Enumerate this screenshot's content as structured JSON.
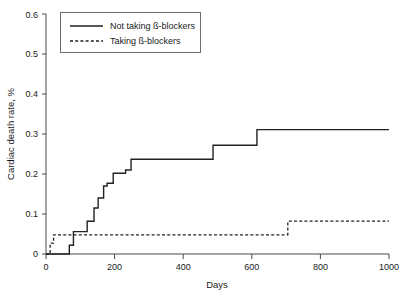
{
  "chart_data": {
    "type": "line",
    "subtype": "step",
    "title": "",
    "xlabel": "Days",
    "ylabel": "Cardiac death rate, %",
    "xlim": [
      0,
      1000
    ],
    "ylim": [
      0,
      0.6
    ],
    "xticks": [
      0,
      200,
      400,
      600,
      800,
      1000
    ],
    "xtick_labels": [
      "0",
      "200",
      "400",
      "600",
      "800",
      "1000"
    ],
    "yticks": [
      0,
      0.1,
      0.2,
      0.3,
      0.4,
      0.5,
      0.6
    ],
    "ytick_labels": [
      "0",
      "0.1",
      "0.2",
      "0.3",
      "0.4",
      "0.5",
      "0.6"
    ],
    "grid": false,
    "legend_position": "top-left",
    "series": [
      {
        "name": "Not taking ß-blockers",
        "style": "solid",
        "color": "#222222",
        "x": [
          0,
          68,
          68,
          80,
          80,
          120,
          120,
          140,
          140,
          152,
          152,
          168,
          168,
          178,
          178,
          196,
          196,
          232,
          232,
          248,
          248,
          290,
          290,
          487,
          487,
          615,
          615,
          1000
        ],
        "y": [
          0,
          0,
          0.022,
          0.022,
          0.056,
          0.056,
          0.082,
          0.082,
          0.115,
          0.115,
          0.14,
          0.14,
          0.17,
          0.17,
          0.177,
          0.177,
          0.202,
          0.202,
          0.21,
          0.21,
          0.237,
          0.237,
          0.237,
          0.237,
          0.272,
          0.272,
          0.311,
          0.311
        ]
      },
      {
        "name": "Taking ß-blockers",
        "style": "dashed",
        "color": "#222222",
        "x": [
          0,
          12,
          12,
          22,
          22,
          705,
          705,
          1000
        ],
        "y": [
          0,
          0,
          0.027,
          0.027,
          0.048,
          0.048,
          0.082,
          0.082
        ]
      }
    ]
  },
  "legend": {
    "entries": [
      {
        "label": "Not taking ß-blockers",
        "style": "solid"
      },
      {
        "label": "Taking ß-blockers",
        "style": "dashed"
      }
    ]
  },
  "axes": {
    "y_title": "Cardiac death rate, %",
    "x_title": "Days",
    "ytick_0": "0",
    "ytick_1": "0.1",
    "ytick_2": "0.2",
    "ytick_3": "0.3",
    "ytick_4": "0.4",
    "ytick_5": "0.5",
    "ytick_6": "0.6",
    "xtick_0": "0",
    "xtick_1": "200",
    "xtick_2": "400",
    "xtick_3": "600",
    "xtick_4": "800",
    "xtick_5": "1000"
  },
  "colors": {
    "series": "#222222",
    "axis": "#4a4a4a",
    "legend_border": "#6d6d6d",
    "background": "#ffffff"
  }
}
